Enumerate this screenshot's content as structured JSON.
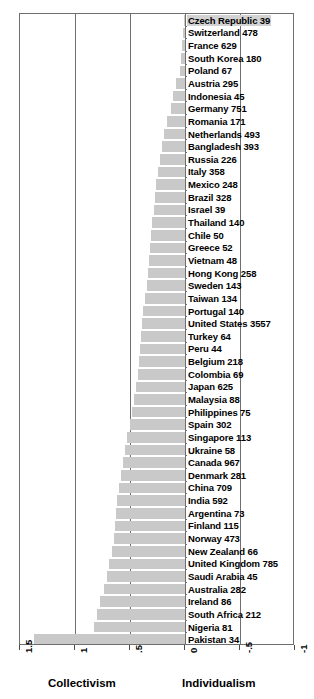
{
  "chart_data": {
    "type": "bar",
    "orientation": "horizontal",
    "title": "",
    "xlabel": "",
    "ylabel": "",
    "xlim": [
      1.5,
      -1
    ],
    "xticks": [
      1.5,
      1,
      0.5,
      0,
      -0.5,
      -1
    ],
    "xtick_labels": [
      "1.5",
      "1",
      ".5",
      "0",
      "-.5",
      "-1"
    ],
    "grid": true,
    "grid_axis": "x",
    "legend": null,
    "axis_captions": {
      "left": "Collectivism",
      "right": "Individualism"
    },
    "bar_color": "#c9c9c9",
    "highlight_color": "#d2d2d2",
    "categories": [
      "Czech Republic",
      "Switzerland",
      "France",
      "South Korea",
      "Poland",
      "Austria",
      "Indonesia",
      "Germany",
      "Romania",
      "Netherlands",
      "Bangladesh",
      "Russia",
      "Italy",
      "Mexico",
      "Brazil",
      "Israel",
      "Thailand",
      "Chile",
      "Greece",
      "Vietnam",
      "Hong Kong",
      "Sweden",
      "Taiwan",
      "Portugal",
      "United States",
      "Turkey",
      "Peru",
      "Belgium",
      "Colombia",
      "Japan",
      "Malaysia",
      "Philippines",
      "Spain",
      "Singapore",
      "Ukraine",
      "Canada",
      "Denmark",
      "China",
      "India",
      "Argentina",
      "Finland",
      "Norway",
      "New Zealand",
      "United Kingdom",
      "Saudi Arabia",
      "Australia",
      "Ireland",
      "South Africa",
      "Nigeria",
      "Pakistan"
    ],
    "counts": [
      39,
      478,
      629,
      180,
      67,
      295,
      45,
      751,
      171,
      493,
      393,
      226,
      358,
      248,
      328,
      39,
      140,
      50,
      52,
      48,
      258,
      143,
      134,
      140,
      3557,
      64,
      44,
      218,
      69,
      625,
      88,
      75,
      302,
      113,
      58,
      967,
      281,
      709,
      592,
      73,
      115,
      473,
      66,
      785,
      45,
      282,
      86,
      212,
      81,
      34
    ],
    "values": [
      0.01,
      0.02,
      0.03,
      0.04,
      0.05,
      0.08,
      0.11,
      0.13,
      0.16,
      0.19,
      0.21,
      0.23,
      0.25,
      0.26,
      0.27,
      0.28,
      0.3,
      0.31,
      0.32,
      0.33,
      0.34,
      0.35,
      0.36,
      0.38,
      0.39,
      0.4,
      0.41,
      0.42,
      0.43,
      0.45,
      0.46,
      0.48,
      0.5,
      0.53,
      0.55,
      0.56,
      0.58,
      0.6,
      0.62,
      0.63,
      0.64,
      0.65,
      0.66,
      0.69,
      0.71,
      0.74,
      0.77,
      0.8,
      0.83,
      1.37
    ],
    "labels": [
      "Czech Republic 39",
      "Switzerland 478",
      "France 629",
      "South Korea 180",
      "Poland 67",
      "Austria 295",
      "Indonesia 45",
      "Germany 751",
      "Romania 171",
      "Netherlands 493",
      "Bangladesh 393",
      "Russia 226",
      "Italy 358",
      "Mexico 248",
      "Brazil 328",
      "Israel 39",
      "Thailand 140",
      "Chile 50",
      "Greece 52",
      "Vietnam 48",
      "Hong Kong 258",
      "Sweden 143",
      "Taiwan 134",
      "Portugal 140",
      "United States 3557",
      "Turkey 64",
      "Peru 44",
      "Belgium 218",
      "Colombia 69",
      "Japan 625",
      "Malaysia 88",
      "Philippines 75",
      "Spain 302",
      "Singapore 113",
      "Ukraine 58",
      "Canada 967",
      "Denmark 281",
      "China 709",
      "India 592",
      "Argentina 73",
      "Finland 115",
      "Norway 473",
      "New Zealand 66",
      "United Kingdom 785",
      "Saudi Arabia 45",
      "Australia 282",
      "Ireland 86",
      "South Africa 212",
      "Nigeria 81",
      "Pakistan 34"
    ],
    "highlighted_index": 0
  }
}
